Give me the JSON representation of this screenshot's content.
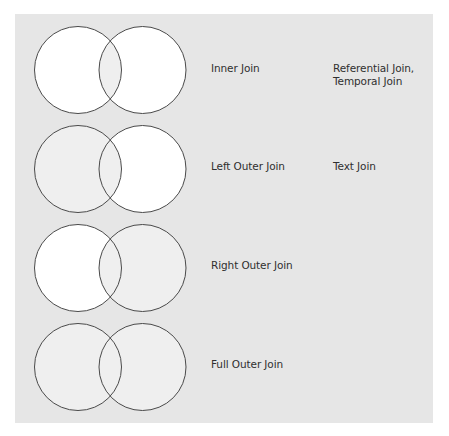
{
  "diagram": {
    "title": "",
    "colors": {
      "background": "#ffffff",
      "panel": "#e6e6e6",
      "circle_empty": "#ffffff",
      "circle_selected": "#efefef",
      "stroke": "#4a4a4a",
      "text": "#2f2f2f"
    },
    "rows": [
      {
        "join_type": "Inner Join",
        "related": "Referential Join,\nTemporal Join",
        "left_filled": false,
        "right_filled": false,
        "intersection_filled": true,
        "center_y": 70
      },
      {
        "join_type": "Left Outer Join",
        "related": "Text Join",
        "left_filled": true,
        "right_filled": false,
        "intersection_filled": true,
        "center_y": 169
      },
      {
        "join_type": "Right Outer Join",
        "related": "",
        "left_filled": false,
        "right_filled": true,
        "intersection_filled": true,
        "center_y": 268
      },
      {
        "join_type": "Full Outer Join",
        "related": "",
        "left_filled": true,
        "right_filled": true,
        "intersection_filled": true,
        "center_y": 367
      }
    ]
  }
}
